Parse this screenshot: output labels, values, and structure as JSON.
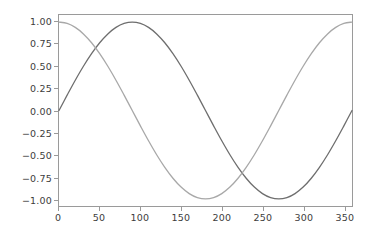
{
  "chart_data": {
    "type": "line",
    "title": "",
    "subtitle": "",
    "xlabel": "",
    "ylabel": "",
    "xlim": [
      0,
      360
    ],
    "ylim": [
      -1.08,
      1.08
    ],
    "xticks": [
      0,
      50,
      100,
      150,
      200,
      250,
      300,
      350
    ],
    "yticks": [
      1.0,
      0.75,
      0.5,
      0.25,
      0.0,
      -0.25,
      -0.5,
      -0.75,
      -1.0
    ],
    "xtick_labels": [
      "0",
      "50",
      "100",
      "150",
      "200",
      "250",
      "300",
      "350"
    ],
    "ytick_labels": [
      "1.00",
      "0.75",
      "0.50",
      "0.25",
      "0.00",
      "−0.25",
      "−0.50",
      "−0.75",
      "−1.00"
    ],
    "grid": false,
    "legend": null,
    "annotations": [],
    "series": [
      {
        "name": "sine",
        "color": "#6e6e6e",
        "linewidth": 1.3,
        "x": [
          0,
          10,
          20,
          30,
          40,
          50,
          60,
          70,
          80,
          90,
          100,
          110,
          120,
          130,
          140,
          150,
          160,
          170,
          180,
          190,
          200,
          210,
          220,
          230,
          240,
          250,
          260,
          270,
          280,
          290,
          300,
          310,
          320,
          330,
          340,
          350,
          360
        ],
        "values": [
          0.0,
          0.1736,
          0.342,
          0.5,
          0.6428,
          0.766,
          0.866,
          0.9397,
          0.9848,
          1.0,
          0.9848,
          0.9397,
          0.866,
          0.766,
          0.6428,
          0.5,
          0.342,
          0.1736,
          0.0,
          -0.1736,
          -0.342,
          -0.5,
          -0.6428,
          -0.766,
          -0.866,
          -0.9397,
          -0.9848,
          -1.0,
          -0.9848,
          -0.9397,
          -0.866,
          -0.766,
          -0.6428,
          -0.5,
          -0.342,
          -0.1736,
          0.0
        ]
      },
      {
        "name": "cosine",
        "color": "#a8a8a8",
        "linewidth": 1.3,
        "x": [
          0,
          10,
          20,
          30,
          40,
          50,
          60,
          70,
          80,
          90,
          100,
          110,
          120,
          130,
          140,
          150,
          160,
          170,
          180,
          190,
          200,
          210,
          220,
          230,
          240,
          250,
          260,
          270,
          280,
          290,
          300,
          310,
          320,
          330,
          340,
          350,
          360
        ],
        "values": [
          1.0,
          0.9848,
          0.9397,
          0.866,
          0.766,
          0.6428,
          0.5,
          0.342,
          0.1736,
          0.0,
          -0.1736,
          -0.342,
          -0.5,
          -0.6428,
          -0.766,
          -0.866,
          -0.9397,
          -0.9848,
          -1.0,
          -0.9848,
          -0.9397,
          -0.866,
          -0.766,
          -0.6428,
          -0.5,
          -0.342,
          -0.1736,
          0.0,
          0.1736,
          0.342,
          0.5,
          0.6428,
          0.766,
          0.866,
          0.9397,
          0.9848,
          1.0
        ]
      }
    ]
  },
  "figure": {
    "background_color": "#ffffff",
    "axes_color": "#9a9a9a",
    "tick_label_color": "#3d3d3d"
  }
}
